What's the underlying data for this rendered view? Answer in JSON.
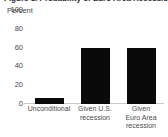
{
  "chart_data": {
    "type": "bar",
    "title": "Figure 3. Probability of Euro Area Recession",
    "ylabel": "Percent",
    "xlabel": "",
    "categories": [
      "Unconditional",
      "Given U.S. recession",
      "Given Euro Area recession"
    ],
    "category_lines": [
      [
        "Unconditional"
      ],
      [
        "Given U.S.",
        "recession"
      ],
      [
        "Given",
        "Euro Area",
        "recession"
      ]
    ],
    "values": [
      6,
      60,
      60
    ],
    "ylim": [
      0,
      100
    ],
    "yticks": [
      100,
      80,
      60,
      40,
      20,
      0
    ],
    "ytick_labels": [
      "100",
      "80",
      "60",
      "40",
      "20",
      "0"
    ],
    "grid": false,
    "legend": false,
    "bar_color": "#0a0a0a",
    "axis_color": "#c9c9c9",
    "text_color": "#4a4a4a",
    "background": "#ffffff"
  }
}
